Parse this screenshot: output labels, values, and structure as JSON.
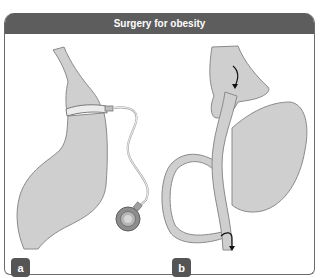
{
  "figure": {
    "title": "Surgery for obesity",
    "panels": [
      {
        "label": "a",
        "description": "Adjustable gastric band with tubing and access port"
      },
      {
        "label": "b",
        "description": "Roux-en-Y gastric bypass"
      }
    ],
    "colors": {
      "header_bg": "#5d5d5d",
      "organ_fill": "#cfcfcf",
      "organ_stroke": "#8a8a8a",
      "label_bg": "#555555",
      "frame": "#6b6b6b"
    }
  }
}
